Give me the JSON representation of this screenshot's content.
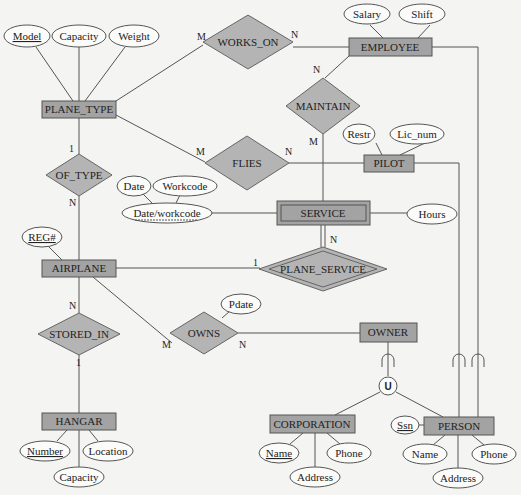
{
  "colors": {
    "background": "#f4f4f2",
    "entity_fill": "#a3a3a3",
    "relationship_fill": "#b4b4b4",
    "attribute_fill": "#fbfbfa",
    "line": "#555555"
  },
  "entities": {
    "plane_type": {
      "label": "PLANE_TYPE",
      "weak": false
    },
    "employee": {
      "label": "EMPLOYEE",
      "weak": false
    },
    "pilot": {
      "label": "PILOT",
      "weak": false
    },
    "service": {
      "label": "SERVICE",
      "weak": true
    },
    "airplane": {
      "label": "AIRPLANE",
      "weak": false
    },
    "owner": {
      "label": "OWNER",
      "weak": false
    },
    "hangar": {
      "label": "HANGAR",
      "weak": false
    },
    "corporation": {
      "label": "CORPORATION",
      "weak": false
    },
    "person": {
      "label": "PERSON",
      "weak": false
    }
  },
  "relationships": {
    "works_on": {
      "label": "WORKS_ON",
      "identifying": false
    },
    "maintain": {
      "label": "MAINTAIN",
      "identifying": false
    },
    "flies": {
      "label": "FLIES",
      "identifying": false
    },
    "of_type": {
      "label": "OF_TYPE",
      "identifying": false
    },
    "plane_service": {
      "label": "PLANE_SERVICE",
      "identifying": true
    },
    "stored_in": {
      "label": "STORED_IN",
      "identifying": false
    },
    "owns": {
      "label": "OWNS",
      "identifying": false
    }
  },
  "attributes": {
    "plane_type_model": {
      "label": "Model",
      "key": true
    },
    "plane_type_capacity": {
      "label": "Capacity",
      "key": false
    },
    "plane_type_weight": {
      "label": "Weight",
      "key": false
    },
    "employee_salary": {
      "label": "Salary",
      "key": false
    },
    "employee_shift": {
      "label": "Shift",
      "key": false
    },
    "pilot_restr": {
      "label": "Restr",
      "key": false
    },
    "pilot_lic_num": {
      "label": "Lic_num",
      "key": false
    },
    "service_date": {
      "label": "Date",
      "key": false
    },
    "service_workcode": {
      "label": "Workcode",
      "key": false
    },
    "service_date_workcode": {
      "label": "Date/workcode",
      "key": "partial"
    },
    "service_hours": {
      "label": "Hours",
      "key": false
    },
    "airplane_reg": {
      "label": "REG#",
      "key": true
    },
    "owns_pdate": {
      "label": "Pdate",
      "key": false
    },
    "hangar_number": {
      "label": "Number",
      "key": true
    },
    "hangar_location": {
      "label": "Location",
      "key": false
    },
    "hangar_capacity": {
      "label": "Capacity",
      "key": false
    },
    "corporation_name": {
      "label": "Name",
      "key": true
    },
    "corporation_phone": {
      "label": "Phone",
      "key": false
    },
    "corporation_address": {
      "label": "Address",
      "key": false
    },
    "person_ssn": {
      "label": "Ssn",
      "key": true
    },
    "person_name": {
      "label": "Name",
      "key": false
    },
    "person_phone": {
      "label": "Phone",
      "key": false
    },
    "person_address": {
      "label": "Address",
      "key": false
    }
  },
  "cardinalities": {
    "works_on_plane_type": "M",
    "works_on_employee": "N",
    "maintain_employee": "N",
    "maintain_service": "M",
    "flies_plane_type": "M",
    "flies_pilot": "N",
    "of_type_plane_type": "1",
    "of_type_airplane": "N",
    "plane_service_airplane": "1",
    "plane_service_service": "N",
    "stored_in_airplane": "N",
    "stored_in_hangar": "1",
    "owns_airplane": "M",
    "owns_owner": "N"
  },
  "union": {
    "symbol": "U",
    "superclass": "OWNER",
    "subclasses": [
      "CORPORATION",
      "PERSON",
      "EMPLOYEE",
      "PILOT"
    ]
  }
}
